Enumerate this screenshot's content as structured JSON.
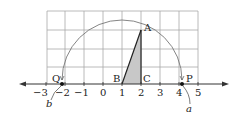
{
  "figure": {
    "unit_px": 19,
    "origin_x": 103,
    "axis_y": 84,
    "grid": {
      "x_from": -3,
      "x_to": 5,
      "y_from": 0,
      "y_to": 4
    },
    "tick_labels": [
      "-3",
      "-2",
      "-1",
      "0",
      "1",
      "2",
      "3",
      "4",
      "5"
    ],
    "points": {
      "A": {
        "label": "A",
        "x": 2,
        "y": 3
      },
      "B": {
        "label": "B",
        "x": 1,
        "y": 0
      },
      "C": {
        "label": "C",
        "x": 2,
        "y": 0
      },
      "P": {
        "label": "P",
        "x": 4.16,
        "y": 0
      },
      "Q": {
        "label": "Q",
        "x": -2.16,
        "y": 0
      }
    },
    "arc": {
      "center": "B",
      "radius": 3.16
    },
    "annotations": {
      "a": "a",
      "b": "b"
    },
    "colors": {
      "grid": "#9a9a9a",
      "shade": "#c8c8c8",
      "line": "#222222",
      "arc": "#777777"
    }
  }
}
